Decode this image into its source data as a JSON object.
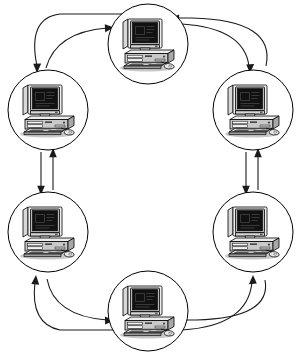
{
  "diagram": {
    "type": "ring-network",
    "canvas": {
      "width": 302,
      "height": 354
    },
    "background_color": "#ffffff",
    "stroke_color": "#1a1a1a",
    "node_count": 6,
    "link_count": 6,
    "link_style": "bidirectional",
    "node_icon": "desktop-computer-icon",
    "nodes": [
      {
        "id": "node-top",
        "label": "",
        "icon": "desktop-computer-icon",
        "cx": 148,
        "cy": 44,
        "r": 40
      },
      {
        "id": "node-right-upper",
        "label": "",
        "icon": "desktop-computer-icon",
        "cx": 253,
        "cy": 110,
        "r": 40
      },
      {
        "id": "node-right-lower",
        "label": "",
        "icon": "desktop-computer-icon",
        "cx": 253,
        "cy": 232,
        "r": 40
      },
      {
        "id": "node-bottom",
        "label": "",
        "icon": "desktop-computer-icon",
        "cx": 148,
        "cy": 311,
        "r": 40
      },
      {
        "id": "node-left-lower",
        "label": "",
        "icon": "desktop-computer-icon",
        "cx": 48,
        "cy": 232,
        "r": 40
      },
      {
        "id": "node-left-upper",
        "label": "",
        "icon": "desktop-computer-icon",
        "cx": 48,
        "cy": 110,
        "r": 40
      }
    ],
    "links": [
      {
        "id": "link-top-to-right-upper",
        "from": "node-top",
        "to": "node-right-upper",
        "shape": "curve",
        "direction": "both"
      },
      {
        "id": "link-right-upper-to-lower",
        "from": "node-right-upper",
        "to": "node-right-lower",
        "shape": "straight",
        "direction": "both"
      },
      {
        "id": "link-right-lower-to-bottom",
        "from": "node-right-lower",
        "to": "node-bottom",
        "shape": "curve",
        "direction": "both"
      },
      {
        "id": "link-bottom-to-left-lower",
        "from": "node-bottom",
        "to": "node-left-lower",
        "shape": "curve",
        "direction": "both"
      },
      {
        "id": "link-left-lower-to-upper",
        "from": "node-left-lower",
        "to": "node-left-upper",
        "shape": "straight",
        "direction": "both"
      },
      {
        "id": "link-left-upper-to-top",
        "from": "node-left-upper",
        "to": "node-top",
        "shape": "curve",
        "direction": "both"
      }
    ]
  }
}
